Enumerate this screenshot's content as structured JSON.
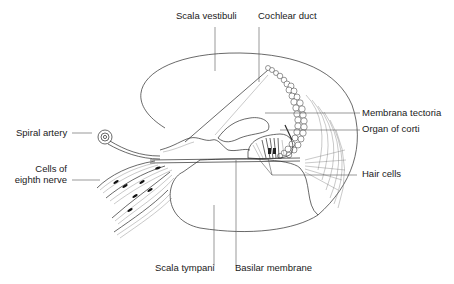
{
  "figure": {
    "background": "#ffffff",
    "line_color": "#2a2a2a"
  },
  "labels": {
    "scala_vestibuli": "Scala vestibuli",
    "cochlear_duct": "Cochlear duct",
    "membrana_tectoria": "Membrana tectoria",
    "organ_of_corti": "Organ of corti",
    "spiral_artery": "Spiral artery",
    "cells_eighth_nerve_line1": "Cells of",
    "cells_eighth_nerve_line2": "eighth nerve",
    "hair_cells": "Hair cells",
    "scala_tympani": "Scala tympani",
    "basilar_membrane": "Basilar membrane"
  }
}
